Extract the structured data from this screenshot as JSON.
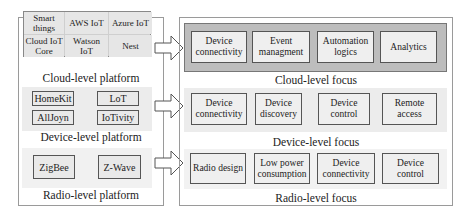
{
  "left_panel": {
    "cloud": {
      "grid": [
        [
          "Smart\nthings",
          "AWS IoT",
          "Azure IoT"
        ],
        [
          "Cloud IoT\nCore",
          "Watson\nIoT",
          "Nest"
        ]
      ],
      "label": "Cloud-level platform"
    },
    "device": {
      "items": [
        "HomeKit",
        "LoT",
        "AllJoyn",
        "IoTivity"
      ],
      "label": "Device-level platform"
    },
    "radio": {
      "items": [
        "ZigBee",
        "Z-Wave"
      ],
      "label": "Radio-level platform"
    }
  },
  "right_panel": {
    "cloud": {
      "items": [
        "Device\nconnectivity",
        "Event\nmanagment",
        "Automation\nlogics",
        "Analytics"
      ],
      "label": "Cloud-level focus"
    },
    "device": {
      "items": [
        "Device\nconnectivity",
        "Device\ndiscovery",
        "Device\ncontrol",
        "Remote\naccess"
      ],
      "label": "Device-level focus"
    },
    "radio": {
      "items": [
        "Radio design",
        "Low power\nconsumption",
        "Device\nconnectivity",
        "Device\ncontrol"
      ],
      "label": "Radio-level focus"
    }
  },
  "arrows": [
    "arrow-right",
    "arrow-right",
    "arrow-right"
  ],
  "colors": {
    "cloud_band": "#bdbdbd",
    "device_band": "#ececec",
    "box_fill": "#efefef",
    "border": "#555555"
  }
}
